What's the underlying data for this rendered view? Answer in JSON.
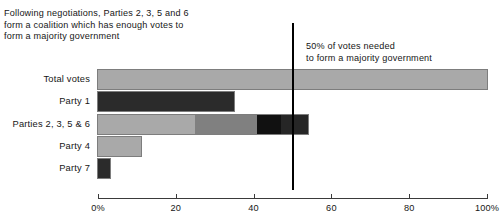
{
  "annotations": {
    "coalition_note": "Following negotiations, Parties 2, 3, 5 and 6\nform a coalition which has enough votes to\nform a majority government",
    "majority_note": "50% of votes needed\nto form a majority government"
  },
  "colors": {
    "light_gray": "#a9a9a9",
    "mid_gray": "#808080",
    "near_black": "#111111",
    "dark_gray": "#2b2b2b",
    "threshold_line": "#000000",
    "axis": "#3a3a3a",
    "bar_outline": "#7d7d7d",
    "text": "#161616"
  },
  "chart_data": {
    "type": "bar",
    "orientation": "horizontal",
    "title": "",
    "subtitle": "",
    "xlabel": "",
    "ylabel": "",
    "xlim": [
      0,
      100
    ],
    "grid": false,
    "legend": "none",
    "xticks": [
      0,
      20,
      40,
      60,
      80,
      100
    ],
    "xticklabels": [
      "0%",
      "20",
      "40",
      "60",
      "80",
      "100%"
    ],
    "categories": [
      "Total votes",
      "Party 1",
      "Parties 2, 3, 5 & 6",
      "Party 4",
      "Party 7"
    ],
    "values": [
      100,
      35,
      54,
      11,
      3
    ],
    "bars": [
      {
        "label": "Total votes",
        "total": 100,
        "stacked": false,
        "segments": [
          {
            "name": "total-votes",
            "value": 100,
            "color": "#a9a9a9"
          }
        ]
      },
      {
        "label": "Party 1",
        "total": 35,
        "stacked": false,
        "segments": [
          {
            "name": "party-1",
            "value": 35,
            "color": "#2b2b2b"
          }
        ]
      },
      {
        "label": "Parties 2, 3, 5 & 6",
        "total": 54,
        "stacked": true,
        "segments": [
          {
            "name": "party-2",
            "value": 25,
            "color": "#a9a9a9"
          },
          {
            "name": "party-3",
            "value": 16,
            "color": "#808080"
          },
          {
            "name": "party-5",
            "value": 6,
            "color": "#111111"
          },
          {
            "name": "party-6",
            "value": 7,
            "color": "#262626"
          }
        ]
      },
      {
        "label": "Party 4",
        "total": 11,
        "stacked": false,
        "segments": [
          {
            "name": "party-4",
            "value": 11,
            "color": "#a9a9a9"
          }
        ]
      },
      {
        "label": "Party 7",
        "total": 3,
        "stacked": false,
        "segments": [
          {
            "name": "party-7",
            "value": 3,
            "color": "#2b2b2b"
          }
        ]
      }
    ],
    "reference_line": {
      "name": "majority-threshold",
      "value": 50,
      "label": "50% of votes needed\nto form a majority government"
    }
  }
}
